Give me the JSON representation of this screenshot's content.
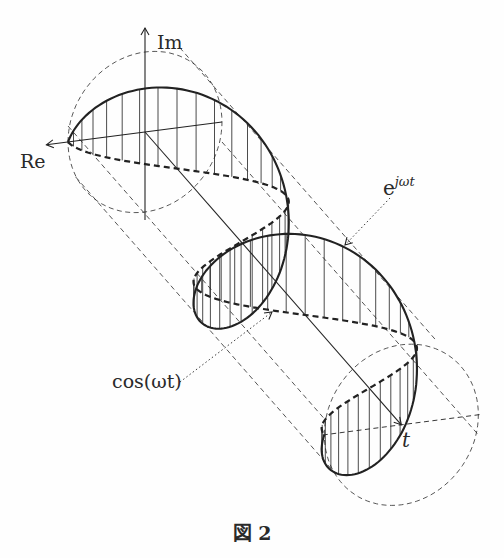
{
  "figure": {
    "caption": "図 2",
    "labels": {
      "imaginary_axis": "Im",
      "real_axis": "Re",
      "time_axis": "t",
      "helix_base": "e",
      "helix_exponent": "jωt",
      "projection": "cos(ωt)"
    },
    "helix": {
      "phase_start_rad": 0,
      "phase_end_rad": 12.566,
      "turns": 2
    },
    "colors": {
      "ink": "#222222",
      "background": "#fefefe"
    }
  }
}
